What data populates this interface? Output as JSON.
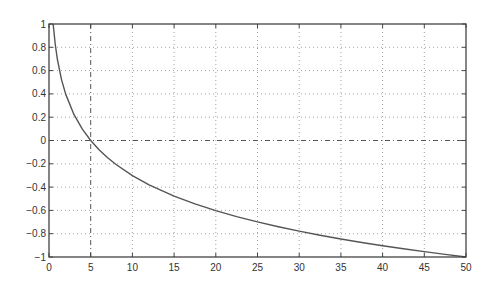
{
  "chart_data": {
    "type": "line",
    "title": "",
    "xlabel": "",
    "ylabel": "",
    "xlim": [
      0,
      50
    ],
    "ylim": [
      -1,
      1
    ],
    "grid": true,
    "grid_style": "dotted",
    "legend": null,
    "x_ticks": [
      0,
      5,
      10,
      15,
      20,
      25,
      30,
      35,
      40,
      45,
      50
    ],
    "x_tick_labels": [
      "0",
      "5",
      "10",
      "15",
      "20",
      "25",
      "30",
      "35",
      "40",
      "45",
      "50"
    ],
    "y_ticks": [
      1,
      0.8,
      0.6,
      0.4,
      0.2,
      0,
      -0.2,
      -0.4,
      -0.6,
      -0.8,
      -1
    ],
    "y_tick_labels": [
      "1",
      "0.8",
      "0.6",
      "0.4",
      "0.2",
      "0",
      "-0.2",
      "-0.4",
      "-0.6",
      "-0.8",
      "-1"
    ],
    "reference_lines": [
      {
        "orientation": "vertical",
        "value": 5,
        "style": "dash-dot"
      },
      {
        "orientation": "horizontal",
        "value": 0,
        "style": "dash-dot"
      }
    ],
    "series": [
      {
        "name": "curve",
        "x": [
          0.5,
          0.75,
          1,
          1.5,
          2,
          3,
          4,
          5,
          6,
          7,
          8,
          10,
          12,
          15,
          17.5,
          20,
          22.5,
          25,
          27.5,
          30,
          32.5,
          35,
          37.5,
          40,
          42.5,
          45,
          47.5,
          50
        ],
        "values": [
          1.0,
          0.824,
          0.699,
          0.523,
          0.398,
          0.222,
          0.097,
          0.0,
          -0.079,
          -0.146,
          -0.204,
          -0.301,
          -0.38,
          -0.477,
          -0.544,
          -0.602,
          -0.653,
          -0.699,
          -0.74,
          -0.778,
          -0.813,
          -0.845,
          -0.875,
          -0.903,
          -0.929,
          -0.954,
          -0.977,
          -1.0
        ]
      }
    ]
  },
  "colors": {
    "background": "#ffffff",
    "axes": "#444444",
    "grid": "#8a8a8a",
    "curve": "#555555",
    "reference": "#555555"
  },
  "layout": {
    "plot_left": 49,
    "plot_top": 24,
    "plot_right": 466,
    "plot_bottom": 257
  }
}
